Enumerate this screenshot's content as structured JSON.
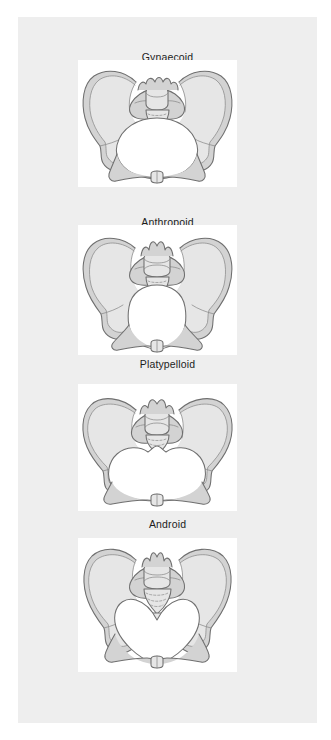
{
  "figure": {
    "background_color": "#ffffff",
    "plate_color": "#eeeeee",
    "panel_color": "#ffffff",
    "bone_fill_color": "#d3d3d3",
    "outline_color": "#6f6f6f",
    "label_color": "#1d1d1d",
    "view": "superior inlet view"
  },
  "panels": [
    {
      "label": "Gynaecoid",
      "icon": "pelvis-inlet-icon",
      "inlet_shape": "rounded oval, transversely slightly wide",
      "caption_top": 34,
      "art": {
        "left": 60,
        "top": 43,
        "width": 159,
        "height": 127
      }
    },
    {
      "label": "Anthropoid",
      "icon": "pelvis-inlet-icon",
      "inlet_shape": "long oval, anteroposteriorly elongated",
      "caption_top": 199,
      "art": {
        "left": 60,
        "top": 208,
        "width": 159,
        "height": 130
      }
    },
    {
      "label": "Platypelloid",
      "icon": "pelvis-inlet-icon",
      "inlet_shape": "flat oval, transversely wide and shallow",
      "caption_top": 341,
      "art": {
        "left": 60,
        "top": 367,
        "width": 159,
        "height": 127
      }
    },
    {
      "label": "Android",
      "icon": "pelvis-inlet-icon",
      "inlet_shape": "heart shaped, narrow anterior segment",
      "caption_top": 501,
      "art": {
        "left": 60,
        "top": 521,
        "width": 159,
        "height": 134
      }
    }
  ]
}
